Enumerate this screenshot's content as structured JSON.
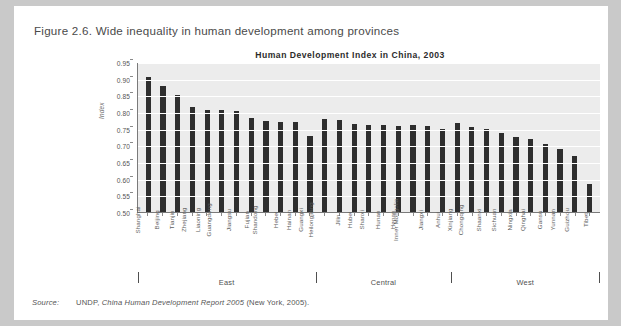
{
  "figure": {
    "caption": "Figure 2.6. Wide inequality in human development among provinces"
  },
  "source": {
    "label": "Source:",
    "publisher": "UNDP,",
    "title": "China Human Development Report 2005",
    "place": "(New York, 2005)."
  },
  "regions": [
    {
      "name": "East",
      "start": 0,
      "end": 12
    },
    {
      "name": "Central",
      "start": 12,
      "end": 21
    },
    {
      "name": "West",
      "start": 21,
      "end": 31
    }
  ],
  "colors": {
    "bar": "#2e2e2e",
    "plot_background": "#ececec",
    "gridline": "#ffffff",
    "axis": "#7a7a7a",
    "page": "#ffffff",
    "backdrop": "#c9c9c9"
  },
  "chart_data": {
    "type": "bar",
    "title": "Human Development Index in China, 2003",
    "xlabel": "",
    "ylabel": "Index",
    "ylim": [
      0.5,
      0.95
    ],
    "ytick_step": 0.05,
    "yticks": [
      "0.95",
      "0.90",
      "0.85",
      "0.80",
      "0.75",
      "0.70",
      "0.65",
      "0.60",
      "0.55",
      "0.50"
    ],
    "grid": true,
    "legend": "none",
    "categories": [
      "Shanghai",
      "Beijing",
      "Tianjin",
      "Zhejiang",
      "Liaoning",
      "Guangdong",
      "Jiangsu",
      "Fujian",
      "Shandong",
      "Hebei",
      "Hainan",
      "Guangxi",
      "Heilongjiang",
      "Jilin",
      "Hubei",
      "Shanxi",
      "Hunan",
      "Henan",
      "Inner Mongolia",
      "Jiangxi",
      "Anhui",
      "Xinjiang",
      "Chongqing",
      "Shaanxi",
      "Sichuan",
      "Ningxia",
      "Qinghai",
      "Gansu",
      "Yunnan",
      "Guizhou",
      "Tibet"
    ],
    "values": [
      0.909,
      0.882,
      0.853,
      0.816,
      0.807,
      0.807,
      0.805,
      0.783,
      0.776,
      0.773,
      0.771,
      0.73,
      0.782,
      0.777,
      0.765,
      0.763,
      0.762,
      0.76,
      0.762,
      0.76,
      0.75,
      0.768,
      0.756,
      0.752,
      0.738,
      0.727,
      0.72,
      0.704,
      0.691,
      0.67,
      0.586
    ]
  }
}
